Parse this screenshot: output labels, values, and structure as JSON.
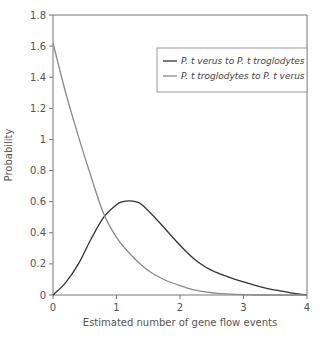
{
  "chart_data": {
    "type": "line",
    "title": "",
    "xlabel": "Estimated number of gene flow events",
    "ylabel": "Probability",
    "xlim": [
      0,
      4
    ],
    "ylim": [
      0,
      1.8
    ],
    "xticks": [
      "0",
      "1",
      "2",
      "3",
      "4"
    ],
    "yticks": [
      "0",
      "0.2",
      "0.4",
      "0.6",
      "0.8",
      "1",
      "1.2",
      "1.4",
      "1.6",
      "1.8"
    ],
    "grid": false,
    "legend_position": "upper right",
    "series": [
      {
        "name": "P. t verus to P. t troglodytes",
        "color": "#333333",
        "x": [
          0,
          0.2,
          0.4,
          0.6,
          0.8,
          1.0,
          1.1,
          1.2,
          1.3,
          1.4,
          1.6,
          1.8,
          2.0,
          2.2,
          2.4,
          2.6,
          2.8,
          3.0,
          3.2,
          3.4,
          3.6,
          3.8,
          4.0
        ],
        "values": [
          0,
          0.08,
          0.2,
          0.36,
          0.5,
          0.58,
          0.6,
          0.605,
          0.6,
          0.58,
          0.5,
          0.41,
          0.32,
          0.24,
          0.18,
          0.14,
          0.11,
          0.085,
          0.06,
          0.04,
          0.025,
          0.01,
          0
        ]
      },
      {
        "name": "P. t troglodytes to P. t verus",
        "color": "#8a8a8a",
        "x": [
          0,
          0.2,
          0.4,
          0.6,
          0.8,
          1.0,
          1.2,
          1.4,
          1.6,
          1.8,
          2.0,
          2.2,
          2.4,
          2.6,
          2.8,
          3.0,
          3.2,
          3.4,
          3.6,
          3.8,
          4.0
        ],
        "values": [
          1.62,
          1.3,
          1.02,
          0.76,
          0.52,
          0.37,
          0.27,
          0.19,
          0.13,
          0.09,
          0.06,
          0.035,
          0.02,
          0.01,
          0.005,
          0.002,
          0,
          0,
          0,
          0,
          0
        ]
      }
    ]
  }
}
